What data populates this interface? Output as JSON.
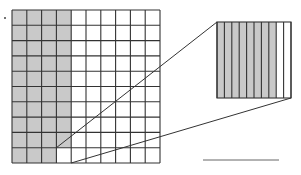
{
  "figure": {
    "colors": {
      "shade": "#c9c9c9",
      "line": "#333333",
      "background": "#ffffff"
    },
    "big_grid": {
      "rows": 10,
      "cols": 10,
      "x": 12,
      "y": 10,
      "width": 148,
      "height": 153,
      "shaded_full_columns": 3,
      "shaded_fourth_column_rows": 9,
      "magnified_cell": {
        "col": 3,
        "row": 9
      }
    },
    "magnified_square": {
      "x": 217,
      "y": 22,
      "width": 74,
      "height": 76,
      "strips": 10,
      "shaded_strips": 8
    },
    "answer_line": {
      "x1": 203,
      "x2": 279,
      "y": 160
    }
  }
}
